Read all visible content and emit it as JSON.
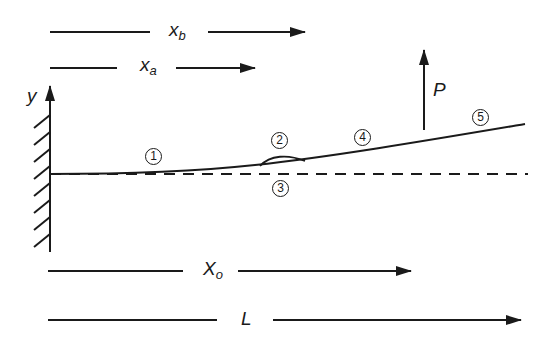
{
  "diagram": {
    "type": "cantilever beam with delamination",
    "colors": {
      "stroke": "#1a1a1a",
      "background": "#ffffff"
    },
    "labels": {
      "x_b": {
        "main": "x",
        "sub": "b"
      },
      "x_a": {
        "main": "x",
        "sub": "a"
      },
      "y_axis": "y",
      "load": "P",
      "x_o": {
        "main": "X",
        "sub": "o"
      },
      "length": "L"
    },
    "regions": [
      {
        "id": "1",
        "label": "1"
      },
      {
        "id": "2",
        "label": "2"
      },
      {
        "id": "3",
        "label": "3"
      },
      {
        "id": "4",
        "label": "4"
      },
      {
        "id": "5",
        "label": "5"
      }
    ]
  }
}
